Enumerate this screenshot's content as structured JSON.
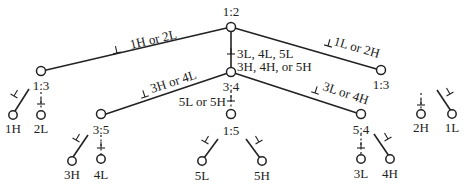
{
  "diagram": {
    "type": "decision-tree",
    "nodes": {
      "root": {
        "label": "1:2"
      },
      "left": {
        "label": "1:3"
      },
      "center": {
        "label": "3:4"
      },
      "right": {
        "label": "1:3"
      },
      "center_left": {
        "label": "3:5"
      },
      "center_mid": {
        "label": "1:5"
      },
      "center_right": {
        "label": "5:4"
      }
    },
    "edge_labels": {
      "root_left": "1H or 2L",
      "root_center_line1": "3L, 4L, 5L",
      "root_center_line2": "3H, 4H, or 5H",
      "root_right": "1L or 2H",
      "center_left": "3H or 4L",
      "center_mid": "5L or 5H",
      "center_right": "3L or 4H"
    },
    "leaves": {
      "l1": "1H",
      "l2": "2L",
      "l3": "3H",
      "l4": "4L",
      "l5": "5L",
      "l6": "5H",
      "l7": "3L",
      "l8": "4H",
      "l9": "2H",
      "l10": "1L"
    },
    "symbols": {
      "perp": "⊥"
    }
  }
}
